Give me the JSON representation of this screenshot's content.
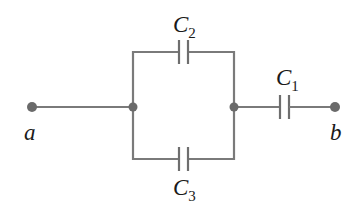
{
  "diagram": {
    "type": "capacitor-circuit",
    "colors": {
      "wire": "#7a7a7a",
      "node": "#6a6a6a",
      "text": "#1a1a1a"
    },
    "terminals": [
      {
        "id": "a",
        "label": "a"
      },
      {
        "id": "b",
        "label": "b"
      }
    ],
    "components": [
      {
        "id": "C1",
        "letter": "C",
        "subscript": "1",
        "type": "capacitor",
        "position": "series-right"
      },
      {
        "id": "C2",
        "letter": "C",
        "subscript": "2",
        "type": "capacitor",
        "position": "parallel-top"
      },
      {
        "id": "C3",
        "letter": "C",
        "subscript": "3",
        "type": "capacitor",
        "position": "parallel-bottom"
      }
    ]
  }
}
